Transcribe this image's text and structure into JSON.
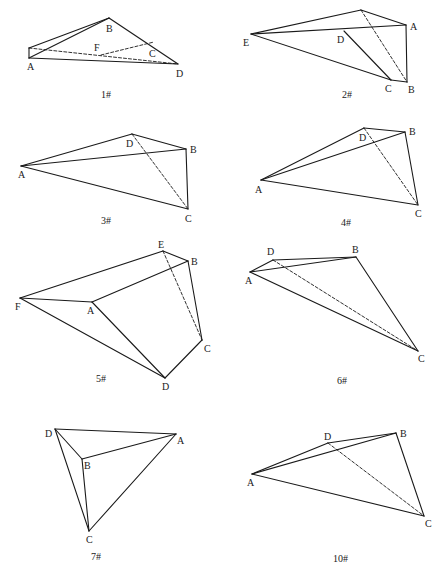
{
  "figures": [
    {
      "id": "1#",
      "caption": "1#",
      "caption_pos": [
        101,
        98
      ],
      "vertices": {
        "A": {
          "pt": [
            29,
            58
          ],
          "label_pos": [
            27,
            70
          ]
        },
        "A2": {
          "pt": [
            29,
            48
          ],
          "label_pos": null
        },
        "B": {
          "pt": [
            109,
            18
          ],
          "label_pos": [
            106,
            32
          ]
        },
        "F": {
          "pt": [
            101,
            55
          ],
          "label_pos": [
            94,
            51
          ]
        },
        "C": {
          "pt": [
            154,
            42
          ],
          "label_pos": [
            149,
            57
          ]
        },
        "D": {
          "pt": [
            178,
            64
          ],
          "label_pos": [
            176,
            77
          ]
        }
      },
      "edges": [
        {
          "from": "A2",
          "to": "B",
          "dashed": false
        },
        {
          "from": "A",
          "to": "B",
          "dashed": false
        },
        {
          "from": "A",
          "to": "A2",
          "dashed": false
        },
        {
          "from": "B",
          "to": "D",
          "dashed": false
        },
        {
          "from": "A",
          "to": "D",
          "dashed": false
        },
        {
          "from": "A2",
          "to": "D",
          "dashed": true
        },
        {
          "from": "F",
          "to": "C",
          "dashed": true
        }
      ]
    },
    {
      "id": "2#",
      "caption": "2#",
      "caption_pos": [
        342,
        98
      ],
      "vertices": {
        "E": {
          "pt": [
            251,
            34
          ],
          "label_pos": [
            243,
            46
          ]
        },
        "T": {
          "pt": [
            361,
            10
          ],
          "label_pos": null
        },
        "A": {
          "pt": [
            406,
            25
          ],
          "label_pos": [
            410,
            30
          ]
        },
        "D": {
          "pt": [
            344,
            31
          ],
          "label_pos": [
            337,
            43
          ]
        },
        "C": {
          "pt": [
            391,
            80
          ],
          "label_pos": [
            385,
            92
          ]
        },
        "B": {
          "pt": [
            407,
            82
          ],
          "label_pos": [
            408,
            93
          ]
        }
      },
      "edges": [
        {
          "from": "E",
          "to": "T",
          "dashed": false
        },
        {
          "from": "T",
          "to": "A",
          "dashed": false
        },
        {
          "from": "E",
          "to": "A",
          "dashed": false
        },
        {
          "from": "A",
          "to": "B",
          "dashed": false
        },
        {
          "from": "E",
          "to": "C",
          "dashed": false
        },
        {
          "from": "C",
          "to": "B",
          "dashed": false
        },
        {
          "from": "D",
          "to": "C",
          "dashed": false
        },
        {
          "from": "T",
          "to": "B",
          "dashed": true
        }
      ]
    },
    {
      "id": "3#",
      "caption": "3#",
      "caption_pos": [
        101,
        224
      ],
      "vertices": {
        "A": {
          "pt": [
            21,
            166
          ],
          "label_pos": [
            18,
            178
          ]
        },
        "D": {
          "pt": [
            132,
            134
          ],
          "label_pos": [
            126,
            147
          ]
        },
        "B": {
          "pt": [
            186,
            149
          ],
          "label_pos": [
            190,
            153
          ]
        },
        "C": {
          "pt": [
            188,
            209
          ],
          "label_pos": [
            185,
            222
          ]
        }
      },
      "edges": [
        {
          "from": "A",
          "to": "D",
          "dashed": false
        },
        {
          "from": "D",
          "to": "B",
          "dashed": false
        },
        {
          "from": "A",
          "to": "B",
          "dashed": false
        },
        {
          "from": "B",
          "to": "C",
          "dashed": false
        },
        {
          "from": "A",
          "to": "C",
          "dashed": false
        },
        {
          "from": "D",
          "to": "C",
          "dashed": true
        }
      ]
    },
    {
      "id": "4#",
      "caption": "4#",
      "caption_pos": [
        341,
        226
      ],
      "vertices": {
        "A": {
          "pt": [
            261,
            180
          ],
          "label_pos": [
            255,
            193
          ]
        },
        "D": {
          "pt": [
            364,
            128
          ],
          "label_pos": [
            359,
            141
          ]
        },
        "B": {
          "pt": [
            405,
            132
          ],
          "label_pos": [
            409,
            135
          ]
        },
        "C": {
          "pt": [
            418,
            205
          ],
          "label_pos": [
            415,
            217
          ]
        }
      },
      "edges": [
        {
          "from": "A",
          "to": "D",
          "dashed": false
        },
        {
          "from": "D",
          "to": "B",
          "dashed": false
        },
        {
          "from": "A",
          "to": "B",
          "dashed": false
        },
        {
          "from": "B",
          "to": "C",
          "dashed": false
        },
        {
          "from": "A",
          "to": "C",
          "dashed": false
        },
        {
          "from": "D",
          "to": "C",
          "dashed": true
        }
      ]
    },
    {
      "id": "5#",
      "caption": "5#",
      "caption_pos": [
        96,
        382
      ],
      "vertices": {
        "E": {
          "pt": [
            163,
            251
          ],
          "label_pos": [
            158,
            248
          ]
        },
        "B": {
          "pt": [
            188,
            261
          ],
          "label_pos": [
            191,
            265
          ]
        },
        "F": {
          "pt": [
            20,
            298
          ],
          "label_pos": [
            15,
            310
          ]
        },
        "A": {
          "pt": [
            92,
            302
          ],
          "label_pos": [
            87,
            314
          ]
        },
        "C": {
          "pt": [
            202,
            340
          ],
          "label_pos": [
            204,
            352
          ]
        },
        "D": {
          "pt": [
            165,
            378
          ],
          "label_pos": [
            162,
            390
          ]
        }
      },
      "edges": [
        {
          "from": "F",
          "to": "E",
          "dashed": false
        },
        {
          "from": "E",
          "to": "B",
          "dashed": false
        },
        {
          "from": "F",
          "to": "A",
          "dashed": false
        },
        {
          "from": "A",
          "to": "B",
          "dashed": false
        },
        {
          "from": "B",
          "to": "C",
          "dashed": false
        },
        {
          "from": "C",
          "to": "D",
          "dashed": false
        },
        {
          "from": "A",
          "to": "D",
          "dashed": false
        },
        {
          "from": "F",
          "to": "D",
          "dashed": false
        },
        {
          "from": "E",
          "to": "C",
          "dashed": true
        }
      ]
    },
    {
      "id": "6#",
      "caption": "6#",
      "caption_pos": [
        337,
        384
      ],
      "vertices": {
        "A": {
          "pt": [
            250,
            272
          ],
          "label_pos": [
            245,
            284
          ]
        },
        "D": {
          "pt": [
            273,
            260
          ],
          "label_pos": [
            267,
            255
          ]
        },
        "B": {
          "pt": [
            356,
            257
          ],
          "label_pos": [
            352,
            253
          ]
        },
        "C": {
          "pt": [
            418,
            351
          ],
          "label_pos": [
            418,
            362
          ]
        }
      },
      "edges": [
        {
          "from": "A",
          "to": "D",
          "dashed": false
        },
        {
          "from": "D",
          "to": "B",
          "dashed": false
        },
        {
          "from": "A",
          "to": "B",
          "dashed": false
        },
        {
          "from": "B",
          "to": "C",
          "dashed": false
        },
        {
          "from": "A",
          "to": "C",
          "dashed": false
        },
        {
          "from": "D",
          "to": "C",
          "dashed": true
        }
      ]
    },
    {
      "id": "7#",
      "caption": "7#",
      "caption_pos": [
        91,
        560
      ],
      "vertices": {
        "D": {
          "pt": [
            55,
            429
          ],
          "label_pos": [
            45,
            437
          ]
        },
        "A": {
          "pt": [
            176,
            434
          ],
          "label_pos": [
            177,
            444
          ]
        },
        "B": {
          "pt": [
            82,
            459
          ],
          "label_pos": [
            84,
            469
          ]
        },
        "C": {
          "pt": [
            89,
            531
          ],
          "label_pos": [
            86,
            543
          ]
        }
      },
      "edges": [
        {
          "from": "D",
          "to": "A",
          "dashed": false
        },
        {
          "from": "D",
          "to": "B",
          "dashed": false
        },
        {
          "from": "B",
          "to": "A",
          "dashed": false
        },
        {
          "from": "D",
          "to": "C",
          "dashed": false
        },
        {
          "from": "B",
          "to": "C",
          "dashed": false
        },
        {
          "from": "A",
          "to": "C",
          "dashed": false
        }
      ]
    },
    {
      "id": "10#",
      "caption": "10#",
      "caption_pos": [
        333,
        562
      ],
      "vertices": {
        "A": {
          "pt": [
            252,
            474
          ],
          "label_pos": [
            247,
            486
          ]
        },
        "D": {
          "pt": [
            328,
            443
          ],
          "label_pos": [
            324,
            440
          ]
        },
        "B": {
          "pt": [
            396,
            433
          ],
          "label_pos": [
            400,
            437
          ]
        },
        "C": {
          "pt": [
            424,
            516
          ],
          "label_pos": [
            425,
            527
          ]
        }
      },
      "edges": [
        {
          "from": "A",
          "to": "D",
          "dashed": false
        },
        {
          "from": "D",
          "to": "B",
          "dashed": false
        },
        {
          "from": "A",
          "to": "B",
          "dashed": false
        },
        {
          "from": "B",
          "to": "C",
          "dashed": false
        },
        {
          "from": "A",
          "to": "C",
          "dashed": false
        },
        {
          "from": "D",
          "to": "C",
          "dashed": true
        }
      ]
    }
  ]
}
